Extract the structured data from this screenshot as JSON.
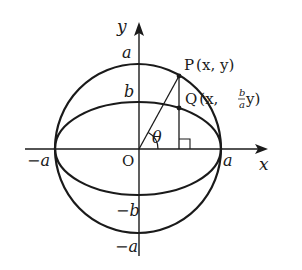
{
  "diagram": {
    "axes": {
      "x_label": "x",
      "y_label": "y",
      "origin_label": "O"
    },
    "tick_labels": {
      "x_neg": "−a",
      "x_pos": "a",
      "y_top_circle": "a",
      "y_top_ellipse": "b",
      "y_bottom_ellipse": "−b",
      "y_bottom_circle": "−a"
    },
    "points": {
      "P": {
        "name": "P",
        "coords": "(x, y)"
      },
      "Q": {
        "name": "Q",
        "coords_prefix": "(x, ",
        "frac_num": "b",
        "frac_den": "a",
        "coords_suffix": "y)"
      }
    },
    "angle_label": "θ",
    "stroke_color": "#1a1a1a",
    "background": "#ffffff"
  }
}
